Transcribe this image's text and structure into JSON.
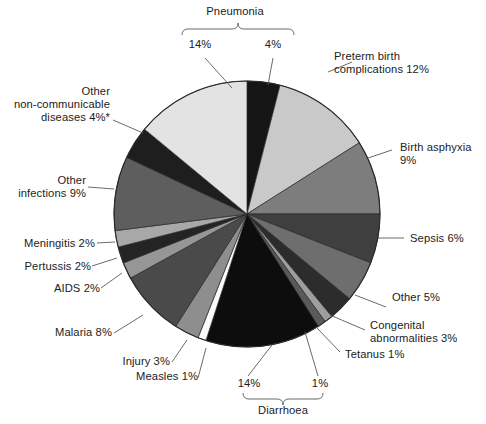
{
  "chart_data": {
    "type": "pie",
    "title": "",
    "subtitle": "",
    "xlabel": "",
    "ylabel": "",
    "legend_position": "callout-labels",
    "grid": false,
    "units": "percent",
    "start_angle_deg": 0,
    "direction": "clockwise",
    "footnote": "*",
    "categories": [
      "Pneumonia (neonatal)",
      "Preterm birth complications",
      "Birth asphyxia",
      "Sepsis",
      "Other",
      "Congenital abnormalities",
      "Tetanus",
      "Diarrhoea (neonatal)",
      "Diarrhoea",
      "Measles",
      "Injury",
      "Malaria",
      "AIDS",
      "Pertussis",
      "Meningitis",
      "Other infections",
      "Other non-communicable diseases",
      "Pneumonia"
    ],
    "values": [
      4,
      12,
      9,
      6,
      5,
      3,
      1,
      1,
      14,
      1,
      3,
      8,
      2,
      2,
      2,
      9,
      4,
      14
    ],
    "slices": [
      {
        "name": "Pneumonia (neonatal)",
        "value": 4,
        "label": "4%",
        "color": "#151515"
      },
      {
        "name": "Preterm birth complications",
        "value": 12,
        "label": "12%",
        "color": "#c9c9c9"
      },
      {
        "name": "Birth asphyxia",
        "value": 9,
        "label": "9%",
        "color": "#7d7d7d"
      },
      {
        "name": "Sepsis",
        "value": 6,
        "label": "6%",
        "color": "#3f3f3f"
      },
      {
        "name": "Other",
        "value": 5,
        "label": "5%",
        "color": "#6e6e6e"
      },
      {
        "name": "Congenital abnormalities",
        "value": 3,
        "label": "3%",
        "color": "#2c2c2c"
      },
      {
        "name": "Tetanus",
        "value": 1,
        "label": "1%",
        "color": "#9e9e9e"
      },
      {
        "name": "Diarrhoea (neonatal)",
        "value": 1,
        "label": "1%",
        "color": "#5a5a5a"
      },
      {
        "name": "Diarrhoea",
        "value": 14,
        "label": "14%",
        "color": "#0d0d0d"
      },
      {
        "name": "Measles",
        "value": 1,
        "label": "1%",
        "color": "#fbfbfb"
      },
      {
        "name": "Injury",
        "value": 3,
        "label": "3%",
        "color": "#8e8e8e"
      },
      {
        "name": "Malaria",
        "value": 8,
        "label": "8%",
        "color": "#4a4a4a"
      },
      {
        "name": "AIDS",
        "value": 2,
        "label": "2%",
        "color": "#969696"
      },
      {
        "name": "Pertussis",
        "value": 2,
        "label": "2%",
        "color": "#242424"
      },
      {
        "name": "Meningitis",
        "value": 2,
        "label": "2%",
        "color": "#a8a8a8"
      },
      {
        "name": "Other infections",
        "value": 9,
        "label": "9%",
        "color": "#5e5e5e"
      },
      {
        "name": "Other non-communicable diseases",
        "value": 4,
        "label": "4%",
        "color": "#1e1e1e"
      },
      {
        "name": "Pneumonia",
        "value": 14,
        "label": "14%",
        "color": "#e3e3e3"
      }
    ],
    "callouts": [
      {
        "id": "pneumonia-group",
        "text": "Pneumonia",
        "kind": "brace-title"
      },
      {
        "id": "pneumonia-14",
        "text": "14%"
      },
      {
        "id": "pneumonia-4",
        "text": "4%"
      },
      {
        "id": "preterm",
        "text": "Preterm birth\ncomplications 12%"
      },
      {
        "id": "birth-asphyxia",
        "text": "Birth asphyxia\n9%"
      },
      {
        "id": "sepsis",
        "text": "Sepsis 6%"
      },
      {
        "id": "other",
        "text": "Other 5%"
      },
      {
        "id": "congenital",
        "text": "Congenital\nabnormalities 3%"
      },
      {
        "id": "tetanus",
        "text": "Tetanus 1%"
      },
      {
        "id": "diarrhoea-1",
        "text": "1%"
      },
      {
        "id": "diarrhoea-14",
        "text": "14%"
      },
      {
        "id": "diarrhoea-group",
        "text": "Diarrhoea",
        "kind": "brace-title"
      },
      {
        "id": "measles",
        "text": "Measles 1%"
      },
      {
        "id": "injury",
        "text": "Injury 3%"
      },
      {
        "id": "malaria",
        "text": "Malaria 8%"
      },
      {
        "id": "aids",
        "text": "AIDS 2%"
      },
      {
        "id": "pertussis",
        "text": "Pertussis 2%"
      },
      {
        "id": "meningitis",
        "text": "Meningitis 2%"
      },
      {
        "id": "other-infections",
        "text": "Other\ninfections 9%"
      },
      {
        "id": "other-ncd",
        "text": "Other\nnon-communicable\ndiseases 4%*"
      }
    ]
  },
  "labels": {
    "pneumonia_title": "Pneumonia",
    "pneumonia_14": "14%",
    "pneumonia_4": "4%",
    "preterm_line1": "Preterm birth",
    "preterm_line2": "complications 12%",
    "asphyxia_line1": "Birth asphyxia",
    "asphyxia_line2": "9%",
    "sepsis": "Sepsis 6%",
    "other": "Other 5%",
    "congenital_line1": "Congenital",
    "congenital_line2": "abnormalities 3%",
    "tetanus": "Tetanus 1%",
    "diarrhoea_1": "1%",
    "diarrhoea_14": "14%",
    "diarrhoea_title": "Diarrhoea",
    "measles": "Measles 1%",
    "injury": "Injury 3%",
    "malaria": "Malaria 8%",
    "aids": "AIDS 2%",
    "pertussis": "Pertussis 2%",
    "meningitis": "Meningitis 2%",
    "other_infections_line1": "Other",
    "other_infections_line2": "infections 9%",
    "other_ncd_line1": "Other",
    "other_ncd_line2": "non-communicable",
    "other_ncd_line3": "diseases 4%*"
  },
  "geometry": {
    "cx": 247,
    "cy": 214,
    "r": 133
  },
  "colors": {
    "background": "#ffffff",
    "text": "#1b1b1b",
    "leader_line": "#5a5a5a",
    "slice_outline": "#2a2a2a"
  }
}
